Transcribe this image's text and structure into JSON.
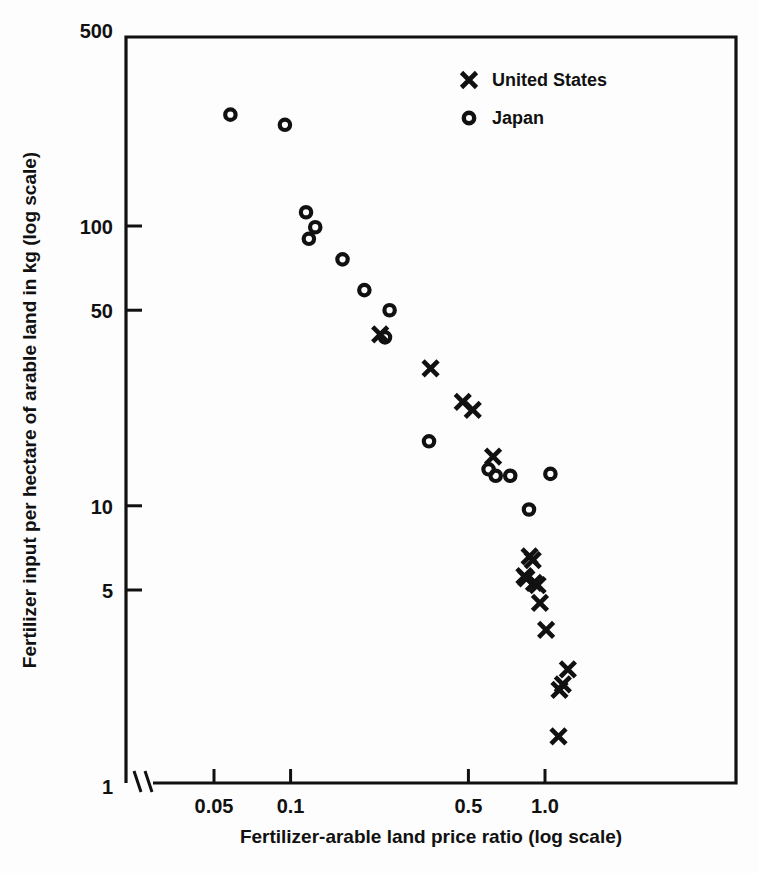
{
  "chart_data": {
    "type": "scatter",
    "title": "",
    "xlabel": "Fertilizer-arable land price ratio (log scale)",
    "ylabel": "Fertilizer input per hectare of arable land in kg (log scale)",
    "xscale": "log",
    "yscale": "log",
    "xlim": [
      0.04,
      1.55
    ],
    "ylim": [
      1,
      500
    ],
    "xticks": [
      0.05,
      0.1,
      0.5,
      1.0
    ],
    "xticklabels": [
      "0.05",
      "0.1",
      "0.5",
      "1.0"
    ],
    "yticks": [
      1,
      5,
      10,
      50,
      100,
      500
    ],
    "yticklabels": [
      "1",
      "5",
      "10",
      "50",
      "100",
      "500"
    ],
    "grid": false,
    "axis_break": true,
    "axis_break_note": "broken x-axis mark between origin and first tick",
    "legend_position": "top-right",
    "series": [
      {
        "name": "United States",
        "marker": "x",
        "color": "#000000",
        "points": [
          [
            0.225,
            41.0
          ],
          [
            0.355,
            31.0
          ],
          [
            0.475,
            23.5
          ],
          [
            0.52,
            22.0
          ],
          [
            0.625,
            15.0
          ],
          [
            0.83,
            5.6
          ],
          [
            0.845,
            5.5
          ],
          [
            0.87,
            6.6
          ],
          [
            0.895,
            6.4
          ],
          [
            0.905,
            5.3
          ],
          [
            0.935,
            5.2
          ],
          [
            0.955,
            4.5
          ],
          [
            1.01,
            3.6
          ],
          [
            1.14,
            2.2
          ],
          [
            1.175,
            2.3
          ],
          [
            1.23,
            2.6
          ],
          [
            1.13,
            1.5
          ]
        ]
      },
      {
        "name": "Japan",
        "marker": "o",
        "color": "#000000",
        "points": [
          [
            0.058,
            250.0
          ],
          [
            0.095,
            230.0
          ],
          [
            0.115,
            112.0
          ],
          [
            0.125,
            99.0
          ],
          [
            0.118,
            90.0
          ],
          [
            0.16,
            76.0
          ],
          [
            0.195,
            59.0
          ],
          [
            0.245,
            50.0
          ],
          [
            0.235,
            40.0
          ],
          [
            0.35,
            17.0
          ],
          [
            0.6,
            13.5
          ],
          [
            0.64,
            12.8
          ],
          [
            0.73,
            12.8
          ],
          [
            1.05,
            13.0
          ],
          [
            0.865,
            9.7
          ]
        ]
      }
    ]
  },
  "legend": {
    "entries": [
      {
        "marker": "x",
        "label": "United States"
      },
      {
        "marker": "o",
        "label": "Japan"
      }
    ]
  }
}
